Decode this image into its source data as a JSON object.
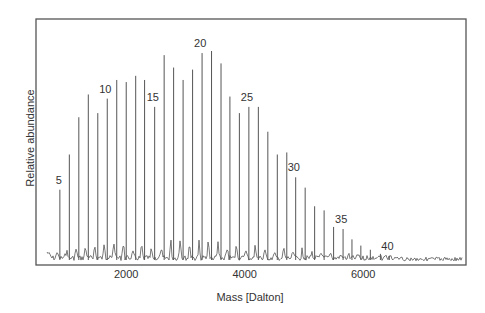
{
  "chart_data": {
    "type": "bar",
    "title": "",
    "xlabel": "Mass [Dalton]",
    "ylabel": "Relative abundance",
    "x_ticks": [
      2000,
      4000,
      6000
    ],
    "x_tick_labels": [
      "2000",
      "4000",
      "6000"
    ],
    "xlim": [
      450,
      7700
    ],
    "ylim": [
      0,
      1
    ],
    "grid": false,
    "legend": null,
    "peak_labels": [
      "5",
      "10",
      "15",
      "20",
      "25",
      "30",
      "35",
      "40"
    ],
    "categories": [
      5,
      6,
      7,
      8,
      9,
      10,
      11,
      12,
      13,
      14,
      15,
      16,
      17,
      18,
      19,
      20,
      21,
      22,
      23,
      24,
      25,
      26,
      27,
      28,
      29,
      30,
      31,
      32,
      33,
      34,
      35,
      36,
      37,
      38,
      39,
      40
    ],
    "series": [
      {
        "name": "Peak abundance",
        "mass": [
          850,
          1010,
          1170,
          1330,
          1490,
          1650,
          1810,
          1970,
          2130,
          2280,
          2450,
          2610,
          2770,
          2930,
          3090,
          3250,
          3410,
          3570,
          3720,
          3880,
          4040,
          4200,
          4360,
          4520,
          4680,
          4830,
          4990,
          5150,
          5310,
          5470,
          5630,
          5780,
          5930,
          6090,
          6260,
          6410
        ],
        "values": [
          0.33,
          0.5,
          0.68,
          0.79,
          0.7,
          0.77,
          0.86,
          0.85,
          0.88,
          0.86,
          0.73,
          0.98,
          0.92,
          0.86,
          0.91,
          0.99,
          1.0,
          0.94,
          0.78,
          0.7,
          0.73,
          0.73,
          0.61,
          0.5,
          0.51,
          0.39,
          0.34,
          0.25,
          0.23,
          0.15,
          0.14,
          0.09,
          0.06,
          0.04,
          0.02,
          0.01
        ]
      }
    ]
  }
}
